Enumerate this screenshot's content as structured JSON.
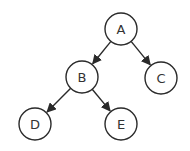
{
  "diagram": {
    "type": "tree",
    "colors": {
      "stroke": "#2a2a2a",
      "fill": "#ffffff",
      "text": "#333333",
      "background": "#ffffff"
    },
    "node_radius": 16,
    "nodes": [
      {
        "id": "A",
        "label": "A",
        "x": 121,
        "y": 29
      },
      {
        "id": "B",
        "label": "B",
        "x": 82,
        "y": 77
      },
      {
        "id": "C",
        "label": "C",
        "x": 161,
        "y": 78
      },
      {
        "id": "D",
        "label": "D",
        "x": 35,
        "y": 124
      },
      {
        "id": "E",
        "label": "E",
        "x": 121,
        "y": 124
      }
    ],
    "edges": [
      {
        "from": "A",
        "to": "B",
        "directed": true
      },
      {
        "from": "A",
        "to": "C",
        "directed": true
      },
      {
        "from": "B",
        "to": "D",
        "directed": true
      },
      {
        "from": "B",
        "to": "E",
        "directed": true
      }
    ]
  }
}
